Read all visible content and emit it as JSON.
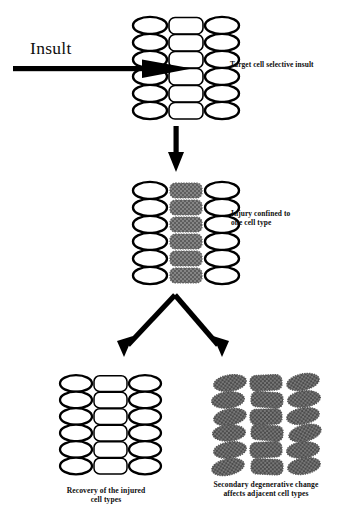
{
  "figure": {
    "background_color": "#ffffff",
    "ink_color": "#000000",
    "shaded_cell_color": "#7a7a7a"
  },
  "labels": {
    "insult": "Insult",
    "stage1": "Target cell selective insult",
    "stage2_line1": "Injury confined to",
    "stage2_line2": "one cell type",
    "outcome_left_line1": "Recovery of the injured",
    "outcome_left_line2": "cell types",
    "outcome_right_line1": "Secondary degenerative change",
    "outcome_right_line2": "affects adjacent cell types"
  },
  "clusters": [
    {
      "id": "cluster-healthy-target",
      "name": "stage-1-tissue",
      "rows": 6,
      "columns": [
        {
          "shape": "ellipse",
          "state": "healthy"
        },
        {
          "shape": "rounded-rect",
          "state": "healthy"
        },
        {
          "shape": "ellipse",
          "state": "healthy"
        }
      ]
    },
    {
      "id": "cluster-injured-middle",
      "name": "stage-2-tissue",
      "rows": 6,
      "columns": [
        {
          "shape": "ellipse",
          "state": "healthy"
        },
        {
          "shape": "rounded-rect",
          "state": "injured"
        },
        {
          "shape": "ellipse",
          "state": "healthy"
        }
      ]
    },
    {
      "id": "cluster-recovered",
      "name": "outcome-left-tissue",
      "rows": 6,
      "columns": [
        {
          "shape": "ellipse",
          "state": "healthy"
        },
        {
          "shape": "rounded-rect",
          "state": "healthy"
        },
        {
          "shape": "ellipse",
          "state": "healthy"
        }
      ]
    },
    {
      "id": "cluster-degenerated",
      "name": "outcome-right-tissue",
      "rows": 6,
      "columns": [
        {
          "shape": "ellipse",
          "state": "degenerated"
        },
        {
          "shape": "rounded-rect",
          "state": "degenerated"
        },
        {
          "shape": "ellipse",
          "state": "degenerated"
        }
      ]
    }
  ],
  "arrows": [
    {
      "name": "insult-arrow",
      "direction": "right"
    },
    {
      "name": "progression-arrow",
      "direction": "down"
    },
    {
      "name": "branch-arrow-left",
      "direction": "down-left"
    },
    {
      "name": "branch-arrow-right",
      "direction": "down-right"
    }
  ]
}
